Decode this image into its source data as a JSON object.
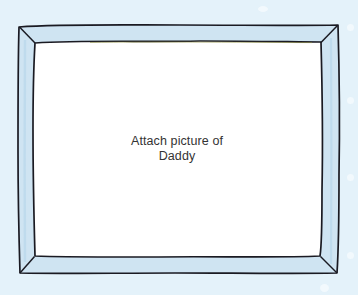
{
  "scene": {
    "title": "Picture frame placeholder",
    "background_color": "#e4f2fa"
  },
  "frame": {
    "name": "hand-drawn picture frame",
    "band_color": "#cfe4f2",
    "band_shadow_color": "#bcd9ec",
    "outline_color": "#1a1a22",
    "mat_color": "#ffffff",
    "accent_color": "#8a8a3a"
  },
  "placeholder": {
    "lines": [
      "Attach picture of",
      "Daddy"
    ],
    "line1": "Attach picture of",
    "line2": "Daddy",
    "text_color": "#333333"
  }
}
